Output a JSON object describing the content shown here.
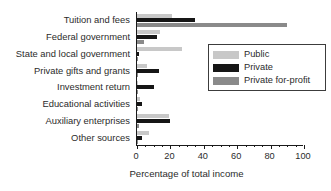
{
  "chart_data": {
    "type": "bar",
    "orientation": "horizontal",
    "title": "",
    "xlabel": "Percentage of total income",
    "ylabel": "",
    "xlim": [
      0,
      100
    ],
    "xticks": [
      0,
      20,
      40,
      60,
      80,
      100
    ],
    "xtick_labels": [
      "0",
      "20",
      "40",
      "60",
      "80",
      "100"
    ],
    "grid": false,
    "legend_position": "center-right",
    "categories": [
      "Tuition and fees",
      "Federal government",
      "State and local government",
      "Private gifts and grants",
      "Investment return",
      "Educational activities",
      "Auxiliary enterprises",
      "Other sources"
    ],
    "series": [
      {
        "name": "Public",
        "color": "#c8c8c8",
        "values": [
          21,
          14,
          27,
          6,
          0.5,
          2,
          19,
          7
        ]
      },
      {
        "name": "Private",
        "color": "#161616",
        "values": [
          35,
          12,
          1,
          13,
          10,
          3,
          20,
          3
        ]
      },
      {
        "name": "Private for-profit",
        "color": "#8a8a8a",
        "values": [
          90,
          4,
          0.5,
          0.5,
          0.3,
          0.5,
          1,
          0.5
        ]
      }
    ]
  },
  "legend": {
    "items": [
      {
        "label": "Public",
        "swatch": "public"
      },
      {
        "label": "Private",
        "swatch": "private"
      },
      {
        "label": "Private for-profit",
        "swatch": "forprofit"
      }
    ]
  }
}
